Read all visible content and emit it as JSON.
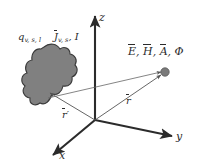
{
  "figure": {
    "name": "electromagnetic-source-observation-geometry",
    "background_color": "#ffffff",
    "ink_color": "#2b2b2b",
    "blob_fill_color": "#808080",
    "blob_stroke_color": "#3a3a3a",
    "point_fill_color": "#7a7a7a"
  },
  "axes": {
    "z": {
      "label": "z",
      "direction": "up"
    },
    "y": {
      "label": "y",
      "direction": "right"
    },
    "x": {
      "label": "x",
      "direction": "down-left"
    },
    "origin": {
      "x": 95,
      "y": 120
    }
  },
  "source_region": {
    "charge_label": {
      "symbol": "q",
      "subscript": "v, s, l"
    },
    "current_label": {
      "symbol": "J",
      "subscript": "v, s",
      "overbar": true
    },
    "current_scalar": "I",
    "separator": ","
  },
  "observation_point": {
    "fields": [
      {
        "symbol": "E",
        "overbar": true
      },
      {
        "symbol": "H",
        "overbar": true
      },
      {
        "symbol": "A",
        "overbar": true
      },
      {
        "symbol": "Φ",
        "overbar": false
      }
    ],
    "separator": ","
  },
  "vectors": {
    "source_position": {
      "symbol": "r",
      "prime": "′",
      "overbar": true
    },
    "observation_position": {
      "symbol": "r",
      "prime": "",
      "overbar": true
    }
  }
}
